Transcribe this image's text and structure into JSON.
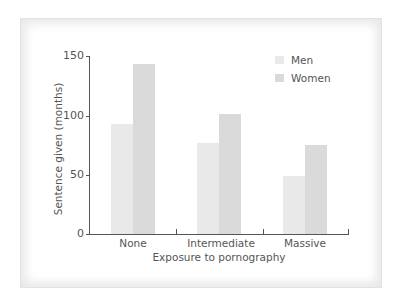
{
  "chart_data": {
    "type": "bar",
    "title": "",
    "xlabel": "Exposure to pornography",
    "ylabel": "Sentence given (months)",
    "categories": [
      "None",
      "Intermediate",
      "Massive"
    ],
    "series": [
      {
        "name": "Men",
        "values": [
          93,
          77,
          49
        ],
        "color": "#e9e9e9"
      },
      {
        "name": "Women",
        "values": [
          143,
          101,
          75
        ],
        "color": "#dadada"
      }
    ],
    "ylim": [
      0,
      150
    ],
    "yticks": [
      0,
      50,
      100,
      150
    ],
    "grid": false,
    "legend_position": "top-right"
  },
  "axis": {
    "y_ticks": [
      "0",
      "50",
      "100",
      "150"
    ],
    "x_title": "Exposure to pornography",
    "y_title": "Sentence given (months)"
  },
  "legend": {
    "men": "Men",
    "women": "Women"
  }
}
